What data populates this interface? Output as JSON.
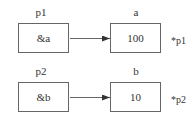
{
  "diagram": {
    "rows": [
      {
        "pointer": {
          "name": "p1",
          "value": "&a"
        },
        "target": {
          "name": "a",
          "value": "100"
        },
        "deref": "*p1"
      },
      {
        "pointer": {
          "name": "p2",
          "value": "&b"
        },
        "target": {
          "name": "b",
          "value": "10"
        },
        "deref": "*p2"
      }
    ],
    "colors": {
      "line": "#666666",
      "text": "#333333",
      "background": "#ffffff"
    }
  }
}
